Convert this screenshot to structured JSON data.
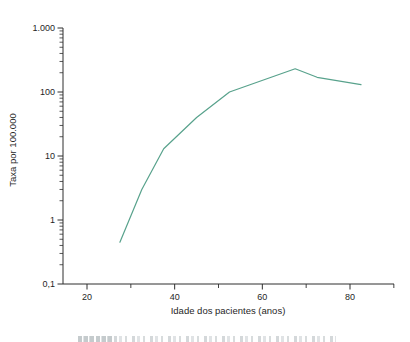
{
  "chart_data": {
    "type": "line",
    "title": "",
    "xlabel": "Idade dos pacientes (anos)",
    "ylabel": "Taxa por 100.000",
    "x": [
      27.5,
      32.5,
      37.5,
      45,
      52.5,
      67.5,
      72.5,
      82.5
    ],
    "series": [
      {
        "name": "taxa",
        "values": [
          0.45,
          3,
          13,
          40,
          100,
          230,
          170,
          130
        ]
      }
    ],
    "y_scale": "log",
    "ylim": [
      0.1,
      1000
    ],
    "y_ticks": [
      {
        "value": 1000,
        "label": "1.000"
      },
      {
        "value": 100,
        "label": "100"
      },
      {
        "value": 10,
        "label": "10"
      },
      {
        "value": 1,
        "label": "1"
      },
      {
        "value": 0.1,
        "label": "0,1"
      }
    ],
    "x_ticks_labeled": [
      20,
      40,
      60,
      80
    ],
    "x_ticks_minor": [
      30,
      50,
      70,
      90
    ],
    "xlim": [
      14.5,
      90
    ],
    "grid": false,
    "legend": null,
    "line_color": "#58a28c",
    "axis_color": "#2e2e2e"
  }
}
